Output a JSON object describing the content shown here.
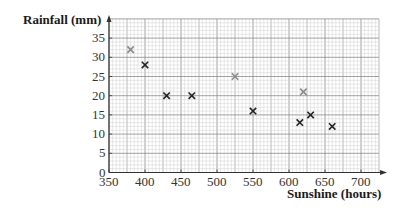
{
  "chart_data": {
    "type": "scatter",
    "title": "",
    "xlabel": "Sunshine (hours)",
    "ylabel": "Rainfall (mm)",
    "xlim": [
      350,
      725
    ],
    "ylim": [
      0,
      40
    ],
    "x_ticks": [
      350,
      400,
      450,
      500,
      550,
      600,
      650,
      700
    ],
    "y_ticks": [
      0,
      5,
      10,
      15,
      20,
      25,
      30,
      35
    ],
    "grid": true,
    "legend": null,
    "series": [
      {
        "name": "black crosses",
        "marker": "x",
        "color": "#222222",
        "points": [
          {
            "x": 400,
            "y": 28
          },
          {
            "x": 430,
            "y": 20
          },
          {
            "x": 465,
            "y": 20
          },
          {
            "x": 550,
            "y": 16
          },
          {
            "x": 615,
            "y": 13
          },
          {
            "x": 630,
            "y": 15
          },
          {
            "x": 660,
            "y": 12
          }
        ]
      },
      {
        "name": "grey crosses",
        "marker": "x",
        "color": "#8a8a8a",
        "points": [
          {
            "x": 380,
            "y": 32
          },
          {
            "x": 525,
            "y": 25
          },
          {
            "x": 620,
            "y": 21
          }
        ]
      }
    ]
  },
  "labels": {
    "y_axis": "Rainfall (mm)",
    "x_axis": "Sunshine (hours)"
  },
  "style": {
    "minor_grid": "#d0d0d0",
    "mid_grid": "#a8a8a8",
    "major_grid": "#8c8c8c",
    "axis": "#333333"
  }
}
